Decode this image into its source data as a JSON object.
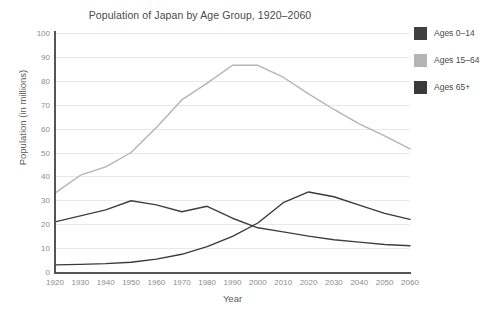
{
  "chart_data": {
    "type": "line",
    "title": "Population of Japan by Age Group, 1920–2060",
    "xlabel": "Year",
    "ylabel": "Population (in millions)",
    "x": [
      1920,
      1930,
      1940,
      1950,
      1960,
      1970,
      1980,
      1990,
      2000,
      2010,
      2020,
      2030,
      2040,
      2050,
      2060
    ],
    "xtick_labels": [
      "1920",
      "1930",
      "1940",
      "1950",
      "1960",
      "1970",
      "1980",
      "1990",
      "2000",
      "2010",
      "2020",
      "2030",
      "2040",
      "2050",
      "2060"
    ],
    "ytick_labels": [
      "0",
      "10",
      "20",
      "30",
      "40",
      "50",
      "60",
      "70",
      "80",
      "90",
      "100"
    ],
    "ylim": [
      0,
      100
    ],
    "xlim": [
      1920,
      2060
    ],
    "ytick_step": 10,
    "grid": true,
    "legend_position": "right",
    "series": [
      {
        "name": "Ages 0–14",
        "color": "#404040",
        "values": [
          21.0,
          23.5,
          26.0,
          29.8,
          28.1,
          25.2,
          27.5,
          22.5,
          18.5,
          16.8,
          15.0,
          13.5,
          12.5,
          11.5,
          11.0
        ]
      },
      {
        "name": "Ages 15–64",
        "color": "#b4b4b4",
        "values": [
          33.0,
          40.5,
          44.0,
          50.0,
          60.5,
          72.0,
          79.0,
          86.5,
          86.5,
          81.5,
          74.5,
          68.0,
          62.0,
          57.0,
          51.5
        ]
      },
      {
        "name": "Ages 65+",
        "color": "#3a3a3a",
        "values": [
          3.0,
          3.2,
          3.5,
          4.1,
          5.4,
          7.4,
          10.6,
          14.9,
          20.5,
          29.0,
          33.5,
          31.5,
          28.0,
          24.5,
          22.0
        ]
      }
    ]
  },
  "legend": {
    "items": [
      {
        "label": "Ages 0–14",
        "color": "#404040"
      },
      {
        "label": "Ages 15–64",
        "color": "#b4b4b4"
      },
      {
        "label": "Ages 65+",
        "color": "#3a3a3a"
      }
    ]
  }
}
